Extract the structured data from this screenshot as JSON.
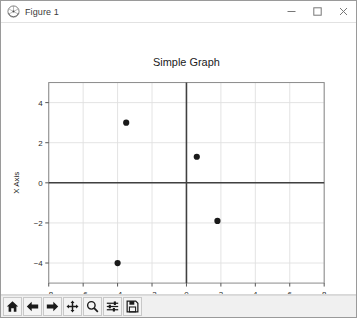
{
  "window": {
    "title": "Figure 1",
    "app_icon": "matplotlib-icon",
    "controls": {
      "minimize": "minimize-icon",
      "maximize": "maximize-icon",
      "close": "close-icon"
    }
  },
  "toolbar": {
    "buttons": [
      {
        "name": "home-button",
        "icon": "home-icon",
        "tooltip": "Reset original view"
      },
      {
        "name": "back-button",
        "icon": "arrow-left-icon",
        "tooltip": "Back to previous view"
      },
      {
        "name": "forward-button",
        "icon": "arrow-right-icon",
        "tooltip": "Forward to next view"
      },
      {
        "name": "pan-button",
        "icon": "move-icon",
        "tooltip": "Pan axes with left mouse, zoom with right"
      },
      {
        "name": "zoom-button",
        "icon": "magnifier-icon",
        "tooltip": "Zoom to rectangle"
      },
      {
        "name": "subplots-button",
        "icon": "sliders-icon",
        "tooltip": "Configure subplots"
      },
      {
        "name": "save-button",
        "icon": "floppy-icon",
        "tooltip": "Save the figure"
      }
    ]
  },
  "chart_data": {
    "type": "scatter",
    "title": "Simple Graph",
    "xlabel": "Y Axis",
    "ylabel": "X Axis",
    "xlim": [
      -8,
      8
    ],
    "ylim": [
      -5,
      5
    ],
    "xticks": [
      -8,
      -6,
      -4,
      -2,
      0,
      2,
      4,
      6,
      8
    ],
    "yticks": [
      4,
      2,
      0,
      -2,
      -4
    ],
    "xticklabels": [
      "−8",
      "−6",
      "−4",
      "−2",
      "0",
      "2",
      "4",
      "6",
      "8"
    ],
    "yticklabels": [
      "4",
      "2",
      "0",
      "−2",
      "−4"
    ],
    "grid": true,
    "legend": null,
    "marker": "o",
    "marker_color": "#1a1a1a",
    "marker_size": 5,
    "axline_color": "#404040",
    "grid_color": "#e0e0e0",
    "points": [
      {
        "x": -3.5,
        "y": 3.0
      },
      {
        "x": 0.6,
        "y": 1.3
      },
      {
        "x": 1.8,
        "y": -1.9
      },
      {
        "x": -4.0,
        "y": -4.0
      }
    ]
  }
}
